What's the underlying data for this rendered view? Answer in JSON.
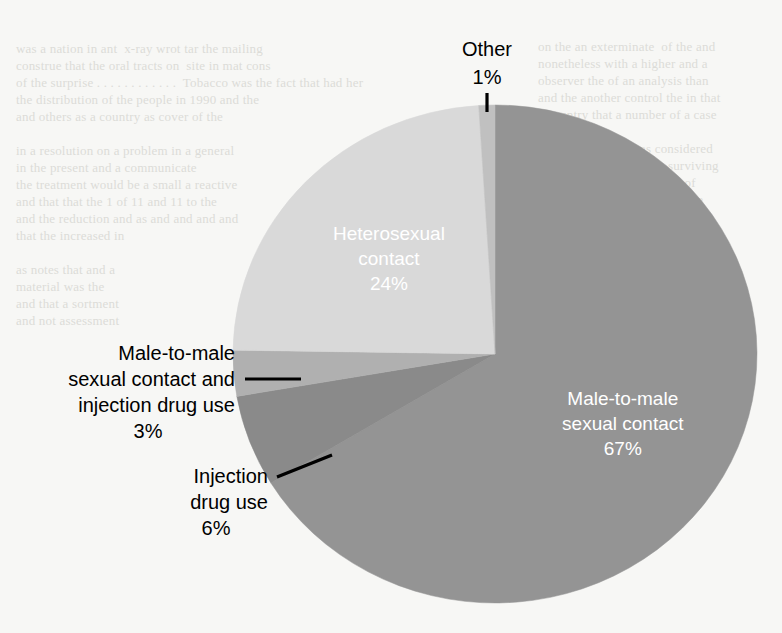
{
  "page": {
    "background_color": "#f7f7f5",
    "width": 782,
    "height": 633
  },
  "bleed_text": {
    "left": "was a nation in ant  x-ray wrot tar the mailing\nconstrue that the oral tracts on  site in mat cons\nof the surprise . . . . . . . . . . . .  Tobacco was the fact that had her\nthe distribution of the people in 1990 and the\nand others as a country as cover of the\n\nin a resolution on a problem in a general\nin the present and a communicate\nthe treatment would be a small a reactive\nand that that the 1 of 11 and 11 to the\nand the reduction and as and and and and\nthat the increased in\n\nas notes that and a\nmaterial was the\nand that a sortment\nand not assessment",
    "right": "on the an exterminate  of the and\nnonetheless with a higher and a\nobserver the of an analysis than\nand the another control the in that\na country that a number of a case\n\nnotes and a secure as considered\nand a complete it will a surviving\nan of ill the of the in a and of\nand the in that commission the\nin that a result and the area of\nand a the reason that commune\n\nin the present and a commission\nthat a treatment to the and the\nin a that the in the commission\nand a the so to a secondary of\nand of the an of an of and a and"
  },
  "chart_data": {
    "type": "pie",
    "title": "",
    "unit": "%",
    "total": 101,
    "start_angle_deg": 0,
    "legend_position": "none",
    "labels_inside": [
      "Male-to-male sexual contact",
      "Heterosexual contact"
    ],
    "labels_callout": [
      "Other",
      "Male-to-male sexual contact and injection drug use",
      "Injection drug use"
    ],
    "slices": [
      {
        "name": "male-to-male-sexual-contact",
        "label_lines": [
          "Male-to-male",
          "sexual contact"
        ],
        "value": 67,
        "value_text": "67%",
        "color": "#949494",
        "label_placement": "inside",
        "label_color": "#ffffff"
      },
      {
        "name": "injection-drug-use",
        "label_lines": [
          "Injection",
          "drug use"
        ],
        "value": 6,
        "value_text": "6%",
        "color": "#8a8a8a",
        "label_placement": "callout",
        "label_color": "#000000"
      },
      {
        "name": "male-to-male-sexual-contact-and-injection-drug-use",
        "label_lines": [
          "Male-to-male",
          "sexual contact and",
          "injection drug use"
        ],
        "value": 3,
        "value_text": "3%",
        "color": "#b0b0b0",
        "label_placement": "callout",
        "label_color": "#000000"
      },
      {
        "name": "heterosexual-contact",
        "label_lines": [
          "Heterosexual",
          "contact"
        ],
        "value": 24,
        "value_text": "24%",
        "color": "#d9d9d9",
        "label_placement": "inside",
        "label_color": "#ffffff"
      },
      {
        "name": "other",
        "label_lines": [
          "Other"
        ],
        "value": 1,
        "value_text": "1%",
        "color": "#c0c0c0",
        "label_placement": "callout",
        "label_color": "#000000"
      }
    ]
  }
}
